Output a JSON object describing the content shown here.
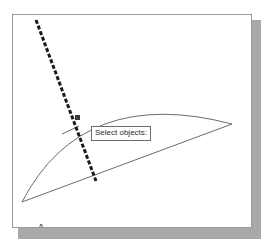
{
  "app": {
    "type": "cad-drawing-viewport",
    "background_color": "#ffffff",
    "frame_border_color": "#9a9a9a",
    "shadow_color": "#a9a9a9"
  },
  "viewport": {
    "frame": {
      "x": 12,
      "y": 14,
      "width": 240,
      "height": 214
    }
  },
  "prompt": {
    "text": "Select objects:",
    "box_color": "#ffffff",
    "border_color": "#6e6e6e",
    "text_color": "#2b2b2b",
    "x": 78,
    "y": 111
  },
  "labels": {
    "point_a": "A",
    "point_b": "B"
  },
  "geometry": {
    "line_color": "#6b6b6b",
    "selection_line_color": "#1a1a1a",
    "points": {
      "a": {
        "x": 21,
        "y": 201
      },
      "b": {
        "x": 231,
        "y": 123
      }
    },
    "arc": {
      "description": "arc from A bulging upward to B",
      "start": {
        "x": 21,
        "y": 201
      },
      "apex": {
        "x": 150,
        "y": 106
      },
      "end": {
        "x": 231,
        "y": 123
      }
    },
    "chord": {
      "description": "straight line from A to B",
      "start": {
        "x": 21,
        "y": 201
      },
      "end": {
        "x": 231,
        "y": 123
      }
    },
    "selection_line": {
      "description": "thick dashed crossing line drawn by cursor",
      "start": {
        "x": 35,
        "y": 20
      },
      "end": {
        "x": 95,
        "y": 180
      },
      "style": "dashed",
      "width": 3
    },
    "leader": {
      "description": "tooltip leader line from prompt box to arc",
      "start": {
        "x": 78,
        "y": 125
      },
      "end": {
        "x": 61,
        "y": 133
      }
    }
  },
  "cursor": {
    "name": "pickbox-cursor",
    "x": 62,
    "y": 100
  }
}
